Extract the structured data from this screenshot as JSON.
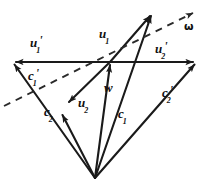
{
  "figure": {
    "type": "vector-diagram",
    "background_color": "#ffffff",
    "stroke_color": "#1a1a1a",
    "dashed_color": "#2a2a2a"
  },
  "labels": [
    {
      "id": "u1p",
      "base": "u",
      "sub": "1",
      "prime": "'",
      "x": 30,
      "y": 34,
      "kind": "vector"
    },
    {
      "id": "u1",
      "base": "u",
      "sub": "1",
      "prime": "",
      "x": 99,
      "y": 25,
      "kind": "vector"
    },
    {
      "id": "u2p",
      "base": "u",
      "sub": "2",
      "prime": "'",
      "x": 155,
      "y": 40,
      "kind": "vector"
    },
    {
      "id": "omega",
      "base": "ω",
      "sub": "",
      "prime": "",
      "x": 184,
      "y": 21,
      "kind": "symbol"
    },
    {
      "id": "c1p",
      "base": "c",
      "sub": "1",
      "prime": "'",
      "x": 28,
      "y": 67,
      "kind": "vector"
    },
    {
      "id": "c2p",
      "base": "c",
      "sub": "2",
      "prime": "'",
      "x": 162,
      "y": 84,
      "kind": "vector"
    },
    {
      "id": "w",
      "base": "w",
      "sub": "",
      "prime": "",
      "x": 104,
      "y": 79,
      "kind": "vector"
    },
    {
      "id": "u2",
      "base": "u",
      "sub": "2",
      "prime": "",
      "x": 78,
      "y": 94,
      "kind": "vector"
    },
    {
      "id": "c2",
      "base": "c",
      "sub": "2",
      "prime": "",
      "x": 44,
      "y": 103,
      "kind": "vector"
    },
    {
      "id": "c1",
      "base": "c",
      "sub": "1",
      "prime": "",
      "x": 118,
      "y": 105,
      "kind": "vector"
    }
  ],
  "geometry": {
    "origin": {
      "x": 95,
      "y": 178
    },
    "junction": {
      "x": 110,
      "y": 62
    },
    "points": {
      "left_end": {
        "x": 13,
        "y": 62
      },
      "right_end": {
        "x": 196,
        "y": 62
      },
      "u1_tip": {
        "x": 152,
        "y": 13
      },
      "omega_tip": {
        "x": 196,
        "y": 11
      },
      "omega_start": {
        "x": 4,
        "y": 106
      },
      "c2_tip": {
        "x": 62,
        "y": 113
      },
      "u2_tip": {
        "x": 68,
        "y": 100
      }
    },
    "solid_vectors": [
      {
        "name": "u1-prime",
        "from": "junction",
        "to": "left_end"
      },
      {
        "name": "u2-prime",
        "from": "junction",
        "to": "right_end"
      },
      {
        "name": "c1-prime",
        "from": "origin",
        "to": "left_end"
      },
      {
        "name": "c2-prime",
        "from": "origin",
        "to": "right_end"
      },
      {
        "name": "u1",
        "from": "junction",
        "to": "u1_tip"
      },
      {
        "name": "c1",
        "from": "origin",
        "to": "u1_tip"
      },
      {
        "name": "w",
        "from": "origin",
        "to": "junction"
      },
      {
        "name": "u2",
        "from": "junction",
        "to": "u2_tip"
      },
      {
        "name": "c2",
        "from": "origin",
        "to": "c2_tip"
      }
    ],
    "dashed_vectors": [
      {
        "name": "omega",
        "from": "omega_start",
        "to": "omega_tip"
      }
    ]
  }
}
